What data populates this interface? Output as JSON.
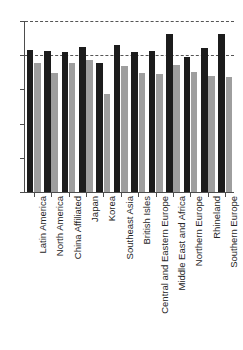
{
  "chart_data": {
    "type": "bar",
    "title": "",
    "subtitle": "",
    "xlabel": "",
    "ylabel": "",
    "ylim": [
      0,
      5
    ],
    "yticks": [
      0,
      1,
      2,
      3,
      4,
      5
    ],
    "ytick_labels": [
      "0",
      "1",
      "2",
      "3",
      "4",
      "5"
    ],
    "grid": true,
    "gridlines": [
      4,
      5
    ],
    "legend": "none",
    "orientation": "vertical",
    "bar_group_mode": "grouped",
    "categories": [
      "Latin America",
      "North America",
      "China Affiliated",
      "Japan",
      "Korea",
      "Southeast Asia",
      "British Isles",
      "Central and Eastern Europe",
      "Middle East and Africa",
      "Northern Europe",
      "Rhineland",
      "Southern Europe"
    ],
    "series": [
      {
        "name": "Series 1",
        "color": "#1c1c1c",
        "values": [
          4.15,
          4.13,
          4.1,
          4.24,
          3.76,
          4.31,
          4.1,
          4.11,
          4.63,
          3.95,
          4.21,
          4.61
        ]
      },
      {
        "name": "Series 2",
        "color": "#9e9e9e",
        "values": [
          3.76,
          3.48,
          3.77,
          3.87,
          2.88,
          3.68,
          3.47,
          3.45,
          3.72,
          3.52,
          3.38,
          3.35
        ]
      }
    ]
  },
  "axis": {
    "y_tick_labels": [
      "5",
      "4",
      "3",
      "2",
      "1",
      "0"
    ]
  }
}
